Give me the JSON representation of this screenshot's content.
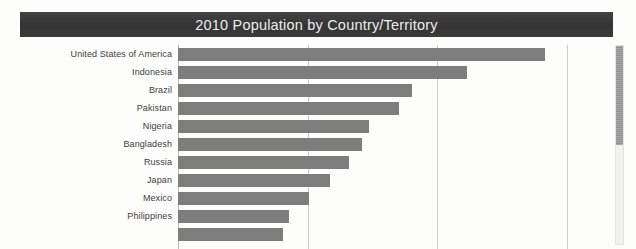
{
  "title": "2010 Population by Country/Territory",
  "scrollbar": {
    "name": "vertical-scrollbar",
    "thumb_top_pct": 0,
    "thumb_height_pct": 50
  },
  "chart_data": {
    "type": "bar",
    "orientation": "horizontal",
    "title": "2010 Population by Country/Territory",
    "xlabel": "",
    "ylabel": "",
    "grid": true,
    "gridlines_x": [
      0,
      500000000,
      1000000000,
      1500000000
    ],
    "xlim": [
      0,
      1600000000
    ],
    "legend": "none",
    "categories": [
      "United States of America",
      "Indonesia",
      "Brazil",
      "Pakistan",
      "Nigeria",
      "Bangladesh",
      "Russia",
      "Japan",
      "Mexico",
      "Philippines",
      ""
    ],
    "values": [
      310000000,
      240000000,
      195000000,
      174000000,
      158000000,
      148000000,
      143000000,
      128000000,
      117000000,
      93000000,
      88000000
    ],
    "bar_pixel_lengths": [
      367,
      289,
      234,
      221,
      191,
      184,
      171,
      152,
      131,
      111,
      105
    ],
    "bar_color": "#7d7d7d",
    "title_bar_color": "#3a3a3a",
    "title_text_color": "#ececec",
    "background_color": "#fdfdfc",
    "gridline_color": "#c9c9c9"
  }
}
